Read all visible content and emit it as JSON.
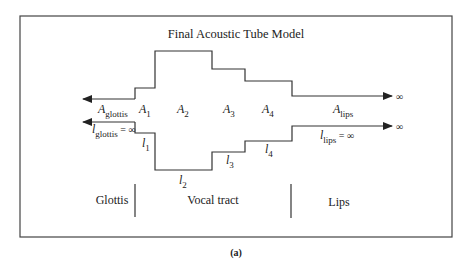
{
  "figure": {
    "title": "Final Acoustic Tube Model",
    "caption": "(a)"
  },
  "areas": {
    "glottis": {
      "base": "A",
      "sub": "glottis"
    },
    "a1": {
      "base": "A",
      "sub": "1"
    },
    "a2": {
      "base": "A",
      "sub": "2"
    },
    "a3": {
      "base": "A",
      "sub": "3"
    },
    "a4": {
      "base": "A",
      "sub": "4"
    },
    "lips": {
      "base": "A",
      "sub": "lips"
    }
  },
  "lengths": {
    "glottis": {
      "base": "l",
      "sub": "glottis",
      "suffix": " = ∞"
    },
    "l1": {
      "base": "l",
      "sub": "1"
    },
    "l2": {
      "base": "l",
      "sub": "2"
    },
    "l3": {
      "base": "l",
      "sub": "3"
    },
    "l4": {
      "base": "l",
      "sub": "4"
    },
    "lips": {
      "base": "l",
      "sub": "lips",
      "suffix": " = ∞"
    }
  },
  "infinity_symbol": "∞",
  "regions": {
    "glottis": "Glottis",
    "vocal_tract": "Vocal tract",
    "lips": "Lips"
  }
}
